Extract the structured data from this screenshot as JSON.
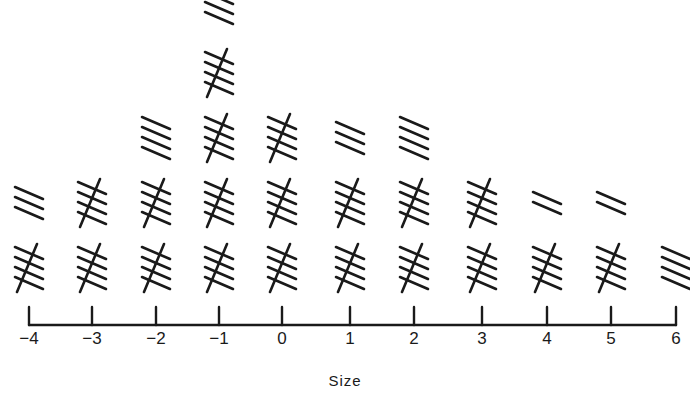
{
  "chart_data": {
    "type": "bar",
    "style": "tally-marks histogram",
    "title": "",
    "xlabel": "Size",
    "ylabel": "",
    "categories": [
      "-4",
      "-3",
      "-2",
      "-1",
      "0",
      "1",
      "2",
      "3",
      "4",
      "5",
      "6"
    ],
    "tick_labels": [
      "−4",
      "−3",
      "−2",
      "−1",
      "0",
      "1",
      "2",
      "3",
      "4",
      "5",
      "6"
    ],
    "values": [
      8,
      10,
      14,
      23,
      15,
      13,
      14,
      10,
      7,
      7,
      4
    ],
    "grid": false,
    "legend": null
  },
  "axis": {
    "tick_x": [
      29,
      92,
      156,
      219,
      282,
      350,
      414,
      482,
      547,
      611,
      676
    ]
  }
}
